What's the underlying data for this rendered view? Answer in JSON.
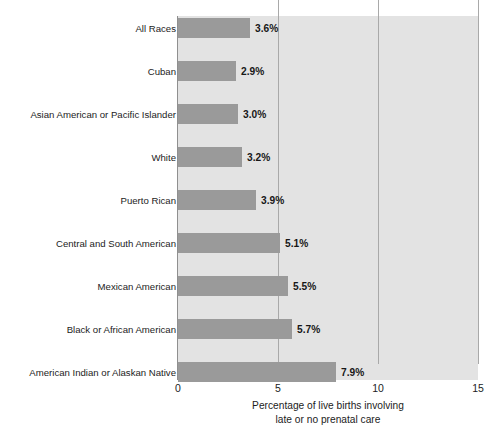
{
  "chart_data": {
    "type": "bar",
    "orientation": "horizontal",
    "title": "",
    "subtitle": "",
    "xlabel": "Percentage of live births involving late or no prenatal care",
    "xlabel_line1": "Percentage of live births involving",
    "xlabel_line2": "late or no prenatal care",
    "ylabel": "",
    "categories": [
      "All Races",
      "Cuban",
      "Asian American or Pacific Islander",
      "White",
      "Puerto Rican",
      "Central and South American",
      "Mexican American",
      "Black or African American",
      "American Indian or Alaskan Native"
    ],
    "values": [
      3.6,
      2.9,
      3.0,
      3.2,
      3.9,
      5.1,
      5.5,
      5.7,
      7.9
    ],
    "value_labels": [
      "3.6%",
      "2.9%",
      "3.0%",
      "3.2%",
      "3.9%",
      "5.1%",
      "5.5%",
      "5.7%",
      "7.9%"
    ],
    "xlim": [
      0,
      15
    ],
    "xticks": [
      0,
      5,
      10,
      15
    ],
    "xtick_labels": [
      "0",
      "5",
      "10",
      "15"
    ],
    "grid": true,
    "grid_axis": "x",
    "legend": null,
    "bar_color": "#9a9a9a",
    "plot_background": "#e3e3e3",
    "gridline_color": "#a9a9a9",
    "text_color": "#1c1c1c"
  }
}
